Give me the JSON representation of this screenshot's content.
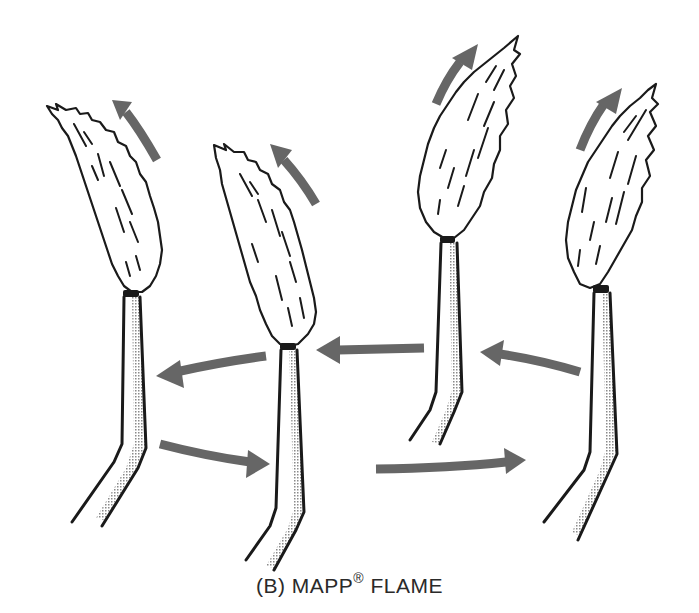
{
  "figure": {
    "caption_prefix": "(B) MAPP",
    "caption_mark": "®",
    "caption_suffix": " FLAME",
    "colors": {
      "outline": "#1a1a1a",
      "arrow": "#666666",
      "stipple": "#9a9a9a",
      "background": "#ffffff"
    },
    "torches": [
      {
        "id": 1,
        "position": "far-left",
        "flame_direction": "tilted left"
      },
      {
        "id": 2,
        "position": "center-left",
        "flame_direction": "tilted left"
      },
      {
        "id": 3,
        "position": "center-right",
        "flame_direction": "tilted right"
      },
      {
        "id": 4,
        "position": "far-right",
        "flame_direction": "tilted right"
      }
    ],
    "arrows": [
      {
        "id": "flame-arrow-1",
        "direction": "up-left"
      },
      {
        "id": "flame-arrow-2",
        "direction": "up-left"
      },
      {
        "id": "flame-arrow-3",
        "direction": "up-right"
      },
      {
        "id": "flame-arrow-4",
        "direction": "up-right"
      },
      {
        "id": "motion-arrow-2-to-1",
        "direction": "left"
      },
      {
        "id": "motion-arrow-3-to-2",
        "direction": "left"
      },
      {
        "id": "motion-arrow-4-to-3",
        "direction": "left"
      },
      {
        "id": "motion-arrow-1-to-2",
        "direction": "right"
      },
      {
        "id": "motion-arrow-2-to-4",
        "direction": "right"
      }
    ]
  }
}
